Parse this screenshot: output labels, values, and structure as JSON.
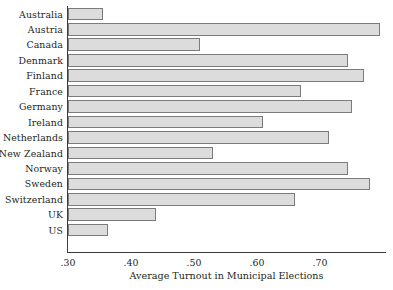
{
  "chart_data": {
    "type": "bar",
    "orientation": "horizontal",
    "title": "",
    "xlabel": "Average Turnout in Municipal Elections",
    "ylabel": "",
    "categories": [
      "Australia",
      "Austria",
      "Canada",
      "Denmark",
      "Finland",
      "France",
      "Germany",
      "Ireland",
      "Netherlands",
      "New Zealand",
      "Norway",
      "Sweden",
      "Switzerland",
      "UK",
      "US"
    ],
    "values": [
      0.356,
      0.795,
      0.51,
      0.745,
      0.77,
      0.67,
      0.75,
      0.61,
      0.715,
      0.53,
      0.745,
      0.78,
      0.66,
      0.44,
      0.363
    ],
    "xlim": [
      0.3,
      0.813
    ],
    "xticks": [
      0.3,
      0.4,
      0.5,
      0.6,
      0.7
    ],
    "xticklabels": [
      ".30",
      ".40",
      ".50",
      ".60",
      ".70"
    ],
    "grid": false,
    "legend": null,
    "bar_fill_color": "#dcdcdc",
    "bar_edge_color": "#7b7b7b",
    "axis_color": "#3b3b3b",
    "background_color": "#ffffff"
  }
}
